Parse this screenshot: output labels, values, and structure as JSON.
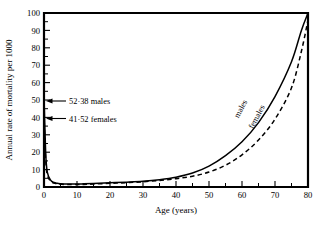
{
  "chart_data": {
    "type": "line",
    "title": "",
    "xlabel": "Age (years)",
    "ylabel": "Annual rate of mortality per 1000",
    "xlim": [
      0,
      80
    ],
    "ylim": [
      0,
      100
    ],
    "grid": false,
    "legend": "inline-curve-labels",
    "x_ticks": [
      0,
      10,
      20,
      30,
      40,
      50,
      60,
      70,
      80
    ],
    "x_tick_labels": [
      "0",
      "10",
      "20",
      "30",
      "40",
      "50",
      "60",
      "70",
      "80"
    ],
    "x_minor_ticks": [
      5,
      15,
      25,
      35,
      45,
      55,
      65,
      75
    ],
    "y_ticks": [
      0,
      10,
      20,
      30,
      40,
      50,
      60,
      70,
      80,
      90,
      100
    ],
    "y_tick_labels": [
      "0",
      "10",
      "20",
      "30",
      "40",
      "50",
      "60",
      "70",
      "80",
      "90",
      "100"
    ],
    "y_minor_ticks": [
      5,
      15,
      25,
      35,
      45,
      55,
      65,
      75,
      85,
      95
    ],
    "series": [
      {
        "name": "males",
        "style": "solid",
        "label": "males",
        "x": [
          0,
          0.5,
          1,
          2,
          3,
          4,
          5,
          7,
          10,
          12,
          15,
          20,
          25,
          30,
          35,
          40,
          45,
          50,
          55,
          60,
          65,
          70,
          75,
          78,
          80
        ],
        "values": [
          52.38,
          20.0,
          8.5,
          4.0,
          2.6,
          2.1,
          1.9,
          1.7,
          1.7,
          1.8,
          2.0,
          2.4,
          2.8,
          3.3,
          4.2,
          5.6,
          8.0,
          12.0,
          18.0,
          26.0,
          37.0,
          52.0,
          72.0,
          90.0,
          100.0
        ]
      },
      {
        "name": "females",
        "style": "dashed",
        "label": "females",
        "x": [
          0,
          0.5,
          1,
          2,
          3,
          4,
          5,
          7,
          10,
          12,
          15,
          20,
          25,
          30,
          35,
          40,
          45,
          50,
          55,
          60,
          65,
          70,
          75,
          78,
          80
        ],
        "values": [
          41.52,
          16.0,
          7.0,
          3.4,
          2.2,
          1.8,
          1.6,
          1.4,
          1.4,
          1.5,
          1.7,
          2.1,
          2.5,
          3.0,
          3.8,
          4.8,
          6.2,
          8.6,
          12.5,
          18.5,
          27.0,
          39.0,
          57.0,
          78.0,
          96.0
        ]
      }
    ],
    "annotations": [
      {
        "name": "males-infant-rate",
        "text": "52·38  males",
        "value": 52.38,
        "at_x": 0,
        "at_y": 52.38
      },
      {
        "name": "females-infant-rate",
        "text": "41·52  females",
        "value": 41.52,
        "at_x": 0,
        "at_y": 41.52
      }
    ],
    "curve_labels": [
      {
        "name": "males",
        "text": "males"
      },
      {
        "name": "females",
        "text": "females"
      }
    ]
  }
}
